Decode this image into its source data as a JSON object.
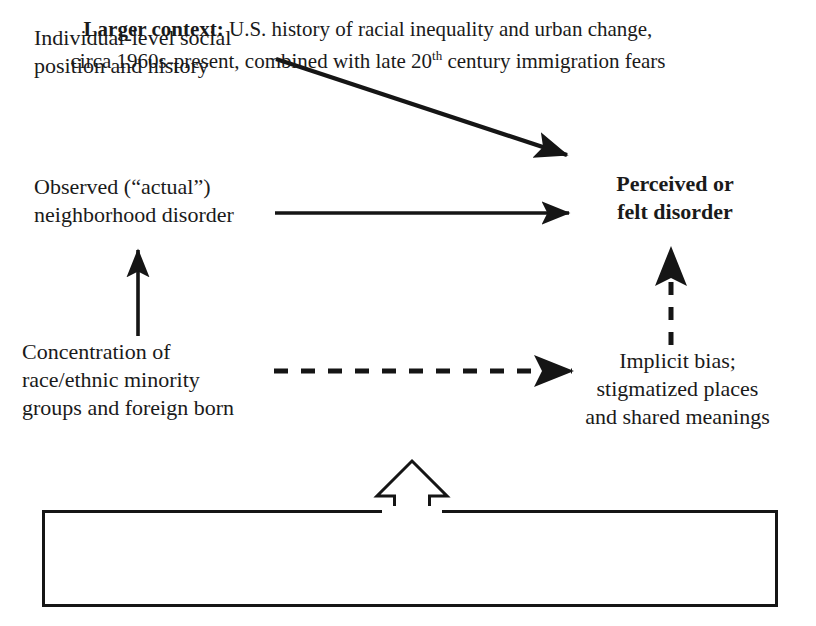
{
  "diagram": {
    "background_color": "#ffffff",
    "line_color": "#151515",
    "text_color": "#1a1a1a"
  },
  "nodes": {
    "individual": {
      "label": "Individual-level social\nposition and history",
      "bold": false
    },
    "observed": {
      "label": "Observed (“actual”)\nneighborhood disorder",
      "bold": false
    },
    "concentration": {
      "label": "Concentration of\nrace/ethnic minority\ngroups and foreign born",
      "bold": false
    },
    "perceived": {
      "label": "Perceived or\nfelt disorder",
      "bold": true
    },
    "implicit": {
      "label": "Implicit bias;\nstigmatized places\nand shared meanings",
      "bold": false
    }
  },
  "context_box": {
    "lead_label": "Larger context:",
    "body_line1": " U.S. history of racial inequality and urban change,",
    "body_line2_before_sup": "circa 1960s-present, combined with late 20",
    "superscript": "th",
    "body_line2_after_sup": " century immigration fears"
  },
  "connectors": [
    {
      "name": "individual-to-perceived",
      "style": "solid",
      "direction": "diagonal-down-right",
      "from": "individual",
      "to": "perceived"
    },
    {
      "name": "observed-to-perceived",
      "style": "solid",
      "direction": "right",
      "from": "observed",
      "to": "perceived"
    },
    {
      "name": "concentration-to-observed",
      "style": "solid",
      "direction": "up",
      "from": "concentration",
      "to": "observed"
    },
    {
      "name": "concentration-to-implicit",
      "style": "dashed",
      "direction": "right",
      "from": "concentration",
      "to": "implicit"
    },
    {
      "name": "implicit-to-perceived",
      "style": "dashed",
      "direction": "up",
      "from": "implicit",
      "to": "perceived"
    },
    {
      "name": "context-to-diagram",
      "style": "hollow-outline",
      "direction": "up",
      "from": "context_box",
      "to": "implicit"
    }
  ]
}
